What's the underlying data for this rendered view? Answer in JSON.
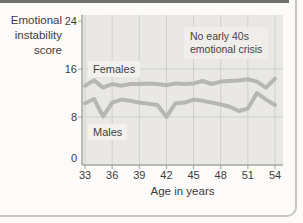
{
  "labels": {
    "y_axis_title": [
      "Emotional",
      "instability",
      "score"
    ],
    "x_axis_title": "Age in years",
    "females_label": "Females",
    "males_label": "Males",
    "annotation_line1": "No early 40s",
    "annotation_line2": "emotional crisis"
  },
  "colors": {
    "line_gray": "#b4b3af",
    "plot_bg": "#e9e8e4",
    "gridline": "#d0cfcb",
    "axis": "#a5a4a0",
    "text": "#3c3c3c",
    "label_box": "#f2f1ed",
    "top_rule": "#6f6f6d",
    "panel_border": "#c6c5c2"
  },
  "chart_data": {
    "type": "line",
    "title": "",
    "xlabel": "Age in years",
    "ylabel": "Emotional instability score",
    "annotation": "No early 40s emotional crisis",
    "x": [
      33,
      34,
      35,
      36,
      37,
      38,
      39,
      40,
      41,
      42,
      43,
      44,
      45,
      46,
      47,
      48,
      49,
      50,
      51,
      52,
      53,
      54
    ],
    "series": [
      {
        "name": "Females",
        "values": [
          13.2,
          14.1,
          12.9,
          13.5,
          13.2,
          13.5,
          13.5,
          13.6,
          13.5,
          13.3,
          13.6,
          13.5,
          13.6,
          14.0,
          13.5,
          13.9,
          14.0,
          14.1,
          14.3,
          13.9,
          12.9,
          14.4
        ]
      },
      {
        "name": "Males",
        "values": [
          10.3,
          11.0,
          8.1,
          10.4,
          10.9,
          10.7,
          10.4,
          10.2,
          10.0,
          8.0,
          10.3,
          10.4,
          10.9,
          10.7,
          10.4,
          10.1,
          9.7,
          9.0,
          9.4,
          12.0,
          10.9,
          10.0
        ]
      }
    ],
    "x_ticks": [
      33,
      36,
      39,
      42,
      45,
      48,
      51,
      54
    ],
    "y_ticks": [
      0,
      8,
      16,
      24
    ],
    "xlim": [
      32.7,
      54.9
    ],
    "ylim": [
      0,
      25
    ],
    "grid": true,
    "legend_position": "inline-labels"
  }
}
